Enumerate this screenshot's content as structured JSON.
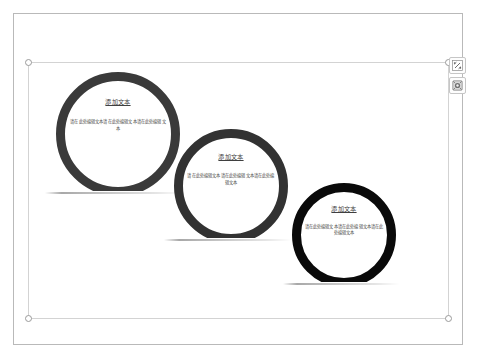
{
  "page": {
    "background_color": "#ffffff",
    "page_border_color": "#b9b9b9"
  },
  "selection": {
    "border_color": "#d3d3d3",
    "handle_fill": "#ffffff",
    "handle_border": "#9a9a9a",
    "handles": [
      {
        "name": "handle-top-left",
        "position": "tl"
      },
      {
        "name": "handle-top-right",
        "position": "tr"
      },
      {
        "name": "handle-bottom-left",
        "position": "bl"
      },
      {
        "name": "handle-bottom-right",
        "position": "br"
      }
    ]
  },
  "float_buttons": [
    {
      "icon": "layout-options-icon",
      "tooltip": "Layout Options"
    },
    {
      "icon": "design-ideas-icon",
      "tooltip": "Design Ideas"
    }
  ],
  "smartart": {
    "type": "ring-list",
    "node_count": 3,
    "nodes": [
      {
        "id": "node-1",
        "title": "添加文本",
        "body": "请在此处编辑文本请在此处编辑文本请在此处编辑文本",
        "ring_color": "#3a3a3a",
        "ring_width": 9,
        "radius": 62,
        "left": 27,
        "top": 9
      },
      {
        "id": "node-2",
        "title": "添加文本",
        "body": "请在此处编辑文本请在此处编辑文本请在此处编辑文本",
        "ring_color": "#323232",
        "ring_width": 9,
        "radius": 57,
        "left": 145,
        "top": 66
      },
      {
        "id": "node-3",
        "title": "添加文本",
        "body": "请在此处编辑文本请在此处编辑文本请在此处编辑文本",
        "ring_color": "#0a0a0a",
        "ring_width": 9,
        "radius": 52,
        "left": 263,
        "top": 120
      }
    ]
  }
}
